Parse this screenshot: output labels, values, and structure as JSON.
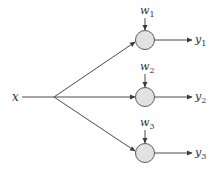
{
  "diagram": {
    "type": "one-to-many weighted fan-out",
    "input": {
      "label": "x"
    },
    "nodes": [
      {
        "id": "n1",
        "weight": {
          "base": "w",
          "sub": "1"
        },
        "output": {
          "base": "y",
          "sub": "1"
        }
      },
      {
        "id": "n2",
        "weight": {
          "base": "w",
          "sub": "2"
        },
        "output": {
          "base": "y",
          "sub": "2"
        }
      },
      {
        "id": "n3",
        "weight": {
          "base": "w",
          "sub": "3"
        },
        "output": {
          "base": "y",
          "sub": "3"
        }
      }
    ],
    "colors": {
      "line": "#4a4a4a",
      "node_fill": "#e2e2e2",
      "node_stroke": "#5a5a5a",
      "text": "#333333"
    }
  }
}
